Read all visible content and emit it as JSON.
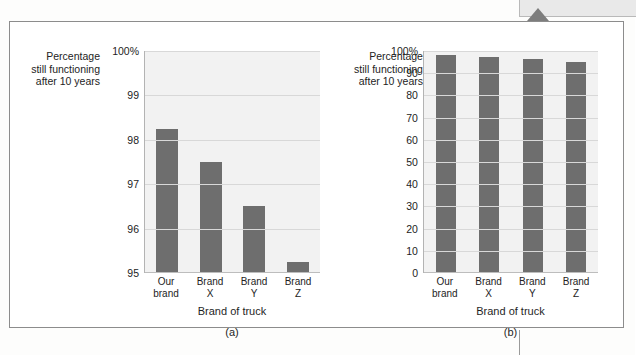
{
  "figure": {
    "background_color": "#f2f2f2",
    "bar_color": "#6e6e6e",
    "frame_color": "#8c8c8c"
  },
  "decor": {
    "tail_icon": "triangle-pointer-icon",
    "top_strip": ""
  },
  "charts": [
    {
      "panel": "(a)",
      "y_axis_title": "Percentage\nstill functioning\nafter 10 years",
      "x_axis_title": "Brand of truck",
      "y_ticks": [
        "100%",
        "99",
        "98",
        "97",
        "96",
        "95"
      ],
      "categories": [
        "Our\nbrand",
        "Brand\nX",
        "Brand\nY",
        "Brand\nZ"
      ],
      "values": [
        98.25,
        97.5,
        96.5,
        95.25
      ]
    },
    {
      "panel": "(b)",
      "y_axis_title": "Percentage\nstill functioning\nafter 10 years",
      "x_axis_title": "Brand of truck",
      "y_ticks": [
        "100%",
        "90",
        "80",
        "70",
        "60",
        "50",
        "40",
        "30",
        "20",
        "10",
        "0"
      ],
      "categories": [
        "Our\nbrand",
        "Brand\nX",
        "Brand\nY",
        "Brand\nZ"
      ],
      "values": [
        98.25,
        97.5,
        96.5,
        95.25
      ]
    }
  ],
  "chart_data": [
    {
      "type": "bar",
      "title": "",
      "panel_label": "(a)",
      "categories": [
        "Our brand",
        "Brand X",
        "Brand Y",
        "Brand Z"
      ],
      "values": [
        98.25,
        97.5,
        96.5,
        95.25
      ],
      "xlabel": "Brand of truck",
      "ylabel": "Percentage still functioning after 10 years",
      "ylim": [
        95,
        100
      ],
      "yticks": [
        95,
        96,
        97,
        98,
        99,
        100
      ],
      "ytick_labels": [
        "95",
        "96",
        "97",
        "98",
        "99",
        "100%"
      ],
      "grid": true,
      "legend": "none",
      "bar_color": "#6e6e6e"
    },
    {
      "type": "bar",
      "title": "",
      "panel_label": "(b)",
      "categories": [
        "Our brand",
        "Brand X",
        "Brand Y",
        "Brand Z"
      ],
      "values": [
        98.25,
        97.5,
        96.5,
        95.25
      ],
      "xlabel": "Brand of truck",
      "ylabel": "Percentage still functioning after 10 years",
      "ylim": [
        0,
        100
      ],
      "yticks": [
        0,
        10,
        20,
        30,
        40,
        50,
        60,
        70,
        80,
        90,
        100
      ],
      "ytick_labels": [
        "0",
        "10",
        "20",
        "30",
        "40",
        "50",
        "60",
        "70",
        "80",
        "90",
        "100%"
      ],
      "grid": true,
      "legend": "none",
      "bar_color": "#6e6e6e"
    }
  ]
}
